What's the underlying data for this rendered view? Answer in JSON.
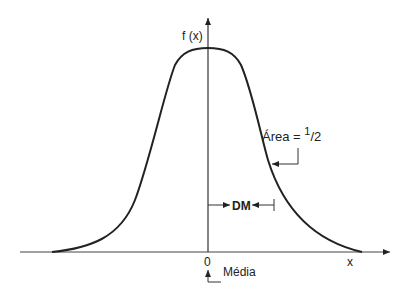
{
  "diagram": {
    "type": "normal-distribution-curve",
    "y_axis_label": "f (x)",
    "x_axis_label": "x",
    "origin_label": "0",
    "mean_label": "Média",
    "area_label": "Área = ",
    "area_fraction_num": "1",
    "area_fraction_den": "2",
    "dm_label": "DM",
    "colors": {
      "stroke": "#222222",
      "background": "#ffffff"
    }
  }
}
